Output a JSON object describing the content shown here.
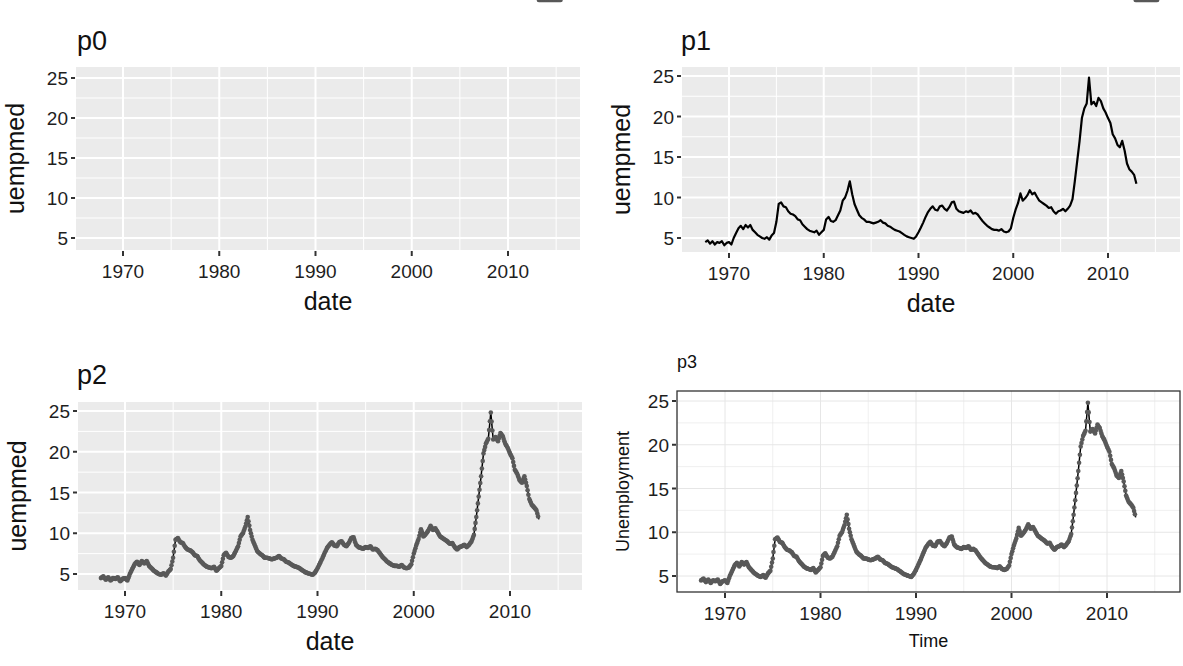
{
  "chart_data": [
    {
      "id": "p0",
      "type": "line",
      "title": "p0",
      "xlabel": "date",
      "ylabel": "uempmed",
      "theme": "grey",
      "geoms": [],
      "xlim": [
        1965.3,
        2017.7
      ],
      "ylim": [
        3.1,
        26.4
      ],
      "x_ticks": [
        1970,
        1980,
        1990,
        2000,
        2010
      ],
      "y_ticks": [
        5,
        10,
        15,
        20,
        25
      ],
      "grid": true,
      "note": "empty panel, no data layer"
    },
    {
      "id": "p1",
      "type": "line",
      "title": "p1",
      "xlabel": "date",
      "ylabel": "uempmed",
      "theme": "grey",
      "geoms": [
        "line"
      ],
      "line_color": "#000000",
      "xlim": [
        1965.3,
        2017.7
      ],
      "ylim": [
        3.1,
        26.4
      ],
      "x_ticks": [
        1970,
        1980,
        1990,
        2000,
        2010
      ],
      "y_ticks": [
        5,
        10,
        15,
        20,
        25
      ],
      "grid": true
    },
    {
      "id": "p2",
      "type": "line",
      "title": "p2",
      "xlabel": "date",
      "ylabel": "uempmed",
      "theme": "grey",
      "geoms": [
        "line",
        "point"
      ],
      "line_color": "#000000",
      "point_color": "#595959",
      "xlim": [
        1965.3,
        2017.7
      ],
      "ylim": [
        3.1,
        26.4
      ],
      "x_ticks": [
        1970,
        1980,
        1990,
        2000,
        2010
      ],
      "y_ticks": [
        5,
        10,
        15,
        20,
        25
      ],
      "grid": true
    },
    {
      "id": "p3",
      "type": "line",
      "title": "p3",
      "xlabel": "Time",
      "ylabel": "Unemployment",
      "theme": "bw",
      "geoms": [
        "line",
        "point"
      ],
      "line_color": "#000000",
      "point_color": "#595959",
      "xlim": [
        1965.3,
        2017.7
      ],
      "ylim": [
        3.1,
        26.4
      ],
      "x_ticks": [
        1970,
        1980,
        1990,
        2000,
        2010
      ],
      "y_ticks": [
        5,
        10,
        15,
        20,
        25
      ],
      "grid": true
    }
  ],
  "series": {
    "name": "uempmed",
    "x": [
      1967.5,
      1967.75,
      1968.0,
      1968.25,
      1968.5,
      1968.75,
      1969.0,
      1969.25,
      1969.5,
      1969.75,
      1970.0,
      1970.25,
      1970.5,
      1970.75,
      1971.0,
      1971.25,
      1971.5,
      1971.75,
      1972.0,
      1972.25,
      1972.5,
      1972.75,
      1973.0,
      1973.25,
      1973.5,
      1973.75,
      1974.0,
      1974.25,
      1974.5,
      1974.75,
      1975.0,
      1975.25,
      1975.5,
      1975.75,
      1976.0,
      1976.25,
      1976.5,
      1976.75,
      1977.0,
      1977.25,
      1977.5,
      1977.75,
      1978.0,
      1978.25,
      1978.5,
      1978.75,
      1979.0,
      1979.25,
      1979.5,
      1979.75,
      1980.0,
      1980.25,
      1980.5,
      1980.75,
      1981.0,
      1981.25,
      1981.5,
      1981.75,
      1982.0,
      1982.25,
      1982.5,
      1982.75,
      1983.0,
      1983.25,
      1983.5,
      1983.75,
      1984.0,
      1984.25,
      1984.5,
      1984.75,
      1985.0,
      1985.25,
      1985.5,
      1985.75,
      1986.0,
      1986.25,
      1986.5,
      1986.75,
      1987.0,
      1987.25,
      1987.5,
      1987.75,
      1988.0,
      1988.25,
      1988.5,
      1988.75,
      1989.0,
      1989.25,
      1989.5,
      1989.75,
      1990.0,
      1990.25,
      1990.5,
      1990.75,
      1991.0,
      1991.25,
      1991.5,
      1991.75,
      1992.0,
      1992.25,
      1992.5,
      1992.75,
      1993.0,
      1993.25,
      1993.5,
      1993.75,
      1994.0,
      1994.25,
      1994.5,
      1994.75,
      1995.0,
      1995.25,
      1995.5,
      1995.75,
      1996.0,
      1996.25,
      1996.5,
      1996.75,
      1997.0,
      1997.25,
      1997.5,
      1997.75,
      1998.0,
      1998.25,
      1998.5,
      1998.75,
      1999.0,
      1999.25,
      1999.5,
      1999.75,
      2000.0,
      2000.25,
      2000.5,
      2000.75,
      2001.0,
      2001.25,
      2001.5,
      2001.75,
      2002.0,
      2002.25,
      2002.5,
      2002.75,
      2003.0,
      2003.25,
      2003.5,
      2003.75,
      2004.0,
      2004.25,
      2004.5,
      2004.75,
      2005.0,
      2005.25,
      2005.5,
      2005.75,
      2006.0,
      2006.25,
      2006.5,
      2006.75,
      2007.0,
      2007.25,
      2007.5,
      2007.75,
      2008.0,
      2008.25,
      2008.5,
      2008.75,
      2009.0,
      2009.25,
      2009.5,
      2009.75,
      2010.0,
      2010.25,
      2010.5,
      2010.75,
      2011.0,
      2011.25,
      2011.5,
      2011.75,
      2012.0,
      2012.25,
      2012.5,
      2012.75,
      2013.0,
      2013.25,
      2013.5,
      2013.75,
      2014.0,
      2014.25,
      2014.5,
      2014.75,
      2015.0,
      2015.25
    ],
    "y": [
      4.5,
      4.7,
      4.3,
      4.6,
      4.2,
      4.5,
      4.4,
      4.6,
      4.1,
      4.4,
      4.5,
      4.2,
      5.0,
      5.6,
      6.2,
      6.5,
      6.1,
      6.6,
      6.3,
      6.6,
      6.0,
      5.7,
      5.4,
      5.2,
      5.0,
      4.9,
      5.1,
      4.8,
      5.3,
      5.6,
      7.0,
      9.2,
      9.4,
      8.9,
      8.8,
      8.3,
      8.0,
      7.9,
      7.7,
      7.3,
      7.2,
      6.7,
      6.4,
      6.1,
      5.9,
      5.8,
      5.7,
      5.9,
      5.4,
      5.7,
      6.0,
      7.3,
      7.6,
      7.1,
      7.0,
      7.2,
      7.8,
      8.4,
      9.6,
      10.0,
      10.8,
      12.0,
      10.4,
      9.2,
      8.5,
      7.8,
      7.5,
      7.3,
      7.0,
      7.0,
      6.9,
      6.8,
      6.9,
      7.0,
      7.2,
      6.9,
      6.8,
      6.5,
      6.4,
      6.2,
      6.0,
      5.9,
      5.8,
      5.6,
      5.4,
      5.2,
      5.1,
      5.0,
      4.9,
      5.2,
      5.7,
      6.3,
      6.9,
      7.6,
      8.2,
      8.6,
      8.9,
      8.5,
      8.4,
      8.9,
      9.0,
      8.6,
      8.4,
      8.8,
      9.4,
      9.5,
      8.6,
      8.3,
      8.2,
      8.1,
      8.3,
      8.2,
      8.4,
      8.0,
      8.1,
      7.9,
      7.5,
      7.1,
      6.8,
      6.5,
      6.3,
      6.1,
      6.0,
      6.0,
      5.9,
      6.1,
      5.8,
      5.7,
      5.8,
      6.2,
      7.5,
      8.5,
      9.3,
      10.5,
      9.6,
      9.9,
      10.3,
      10.9,
      10.4,
      10.6,
      10.1,
      9.6,
      9.4,
      9.2,
      9.0,
      8.7,
      8.8,
      8.3,
      8.0,
      8.3,
      8.4,
      8.6,
      8.3,
      8.6,
      9.0,
      9.8,
      12.0,
      14.5,
      17.0,
      19.8,
      21.0,
      21.6,
      24.8,
      21.5,
      21.8,
      21.3,
      22.3,
      21.9,
      21.0,
      20.5,
      19.8,
      19.2,
      17.8,
      17.3,
      16.5,
      16.2,
      17.0,
      15.8,
      14.2,
      13.5,
      13.2,
      12.8,
      11.7
    ]
  },
  "panels_layout": {
    "p0": {
      "title_x": 77,
      "title_y": 50,
      "left": 76,
      "top": 67,
      "right": 580,
      "bottom": 250,
      "ytick_25": 78,
      "ytick_5": 238,
      "xtick_1970": 123,
      "xtick_2010": 508
    },
    "p1": {
      "title_x": 681,
      "title_y": 50,
      "left": 682,
      "top": 67,
      "right": 1180,
      "bottom": 252,
      "ytick_25": 76,
      "ytick_5": 238,
      "xtick_1970": 729,
      "xtick_2010": 1108
    },
    "p2": {
      "title_x": 77,
      "title_y": 384,
      "left": 78,
      "top": 402,
      "right": 582,
      "bottom": 590,
      "ytick_25": 411,
      "ytick_5": 574,
      "xtick_1970": 125,
      "xtick_2010": 510
    },
    "p3": {
      "title_x": 677,
      "title_y": 368,
      "left": 677,
      "top": 391,
      "right": 1180,
      "bottom": 592,
      "ytick_25": 401,
      "ytick_5": 576,
      "xtick_1970": 725,
      "xtick_2010": 1107
    }
  },
  "colors": {
    "grey_panel_bg": "#ebebeb",
    "grey_grid": "#ffffff",
    "bw_panel_bg": "#ffffff",
    "bw_grid": "#e6e6e6",
    "bw_border": "#333333",
    "tick_color": "#333333",
    "text": "#111111"
  }
}
